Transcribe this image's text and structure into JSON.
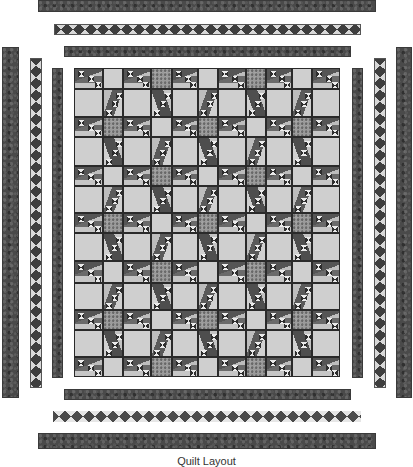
{
  "quilt": {
    "caption": "Quilt Layout",
    "colors": {
      "background": "#ffffff",
      "dark_fabric": "#4a4a4a",
      "light_fabric": "#cfcfcf",
      "speckled_fabric": "#9a9a9a",
      "seam": "#2a2a2a"
    },
    "borders": {
      "top": [
        {
          "type": "fabric-dark",
          "x": 38,
          "y": 0,
          "w": 338,
          "h": 12
        },
        {
          "type": "hourglass-h",
          "x": 54,
          "y": 24,
          "w": 307,
          "h": 11
        },
        {
          "type": "fabric-dark",
          "x": 64,
          "y": 46,
          "w": 287,
          "h": 11
        }
      ],
      "bottom": [
        {
          "type": "fabric-dark",
          "x": 64,
          "y": 389,
          "w": 287,
          "h": 11
        },
        {
          "type": "hourglass-hb",
          "x": 53,
          "y": 411,
          "w": 308,
          "h": 11
        },
        {
          "type": "fabric-dark",
          "x": 38,
          "y": 433,
          "w": 338,
          "h": 16
        }
      ],
      "left": [
        {
          "type": "fabric-dark",
          "x": 2,
          "y": 47,
          "w": 17,
          "h": 351
        },
        {
          "type": "hourglass-v",
          "x": 30,
          "y": 58,
          "w": 12,
          "h": 330
        },
        {
          "type": "fabric-dark",
          "x": 52,
          "y": 68,
          "w": 11,
          "h": 310
        }
      ],
      "right": [
        {
          "type": "fabric-dark",
          "x": 352,
          "y": 68,
          "w": 11,
          "h": 310
        },
        {
          "type": "hourglass-v",
          "x": 374,
          "y": 58,
          "w": 12,
          "h": 330
        },
        {
          "type": "fabric-dark",
          "x": 396,
          "y": 47,
          "w": 16,
          "h": 351
        }
      ]
    },
    "center": {
      "columns": 11,
      "rows": 13,
      "col_edges": [
        0,
        29,
        49,
        77,
        98,
        124,
        144,
        172,
        192,
        218,
        238,
        266
      ],
      "row_edges": [
        0,
        21,
        49,
        69,
        98,
        118,
        145,
        165,
        193,
        215,
        242,
        262,
        289,
        309
      ],
      "col_pattern": "L S L S L S L S L S L",
      "row_pattern": "S L S L S L S L S L S L S",
      "cell_types": {
        "large_large": "light-square",
        "small_small": "cornerstone (alternating light/speckled checkerboard)",
        "large_col_small_row": "horizontal staircase block with hourglass units",
        "small_col_large_row": "vertical staircase block with hourglass units"
      }
    }
  }
}
